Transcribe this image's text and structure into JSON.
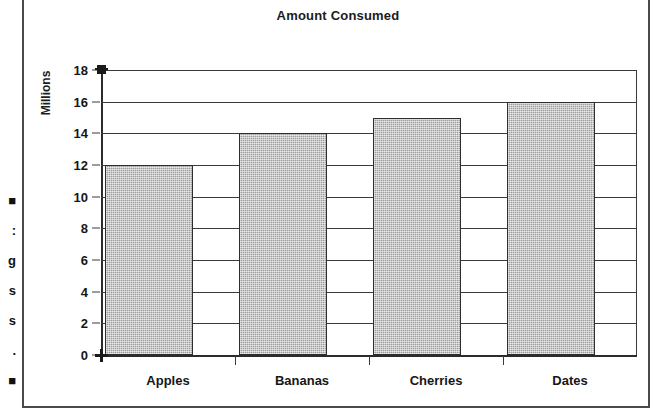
{
  "figure": {
    "margin_fragments": [
      "■",
      ":",
      "g",
      "s",
      "s",
      ".",
      "■"
    ]
  },
  "chart_data": {
    "type": "bar",
    "title": "Amount Consumed",
    "xlabel": "",
    "ylabel": "Millions",
    "categories": [
      "Apples",
      "Bananas",
      "Cherries",
      "Dates"
    ],
    "values": [
      12,
      14,
      15,
      16
    ],
    "ylim": [
      0,
      18
    ],
    "ytick_step": 2,
    "yticks": [
      0,
      2,
      4,
      6,
      8,
      10,
      12,
      14,
      16,
      18
    ],
    "ytick_labels": [
      "0",
      "2",
      "4",
      "6",
      "8",
      "10",
      "12",
      "14",
      "16",
      "18"
    ],
    "grid": true,
    "grid_axis": "y",
    "legend": false,
    "bar_fill_color": "#9c9c9c",
    "bar_edge_color": "#2e2e2e",
    "axis_color": "#2b2b2b",
    "text_color": "#161616",
    "background_color": "#ffffff"
  }
}
